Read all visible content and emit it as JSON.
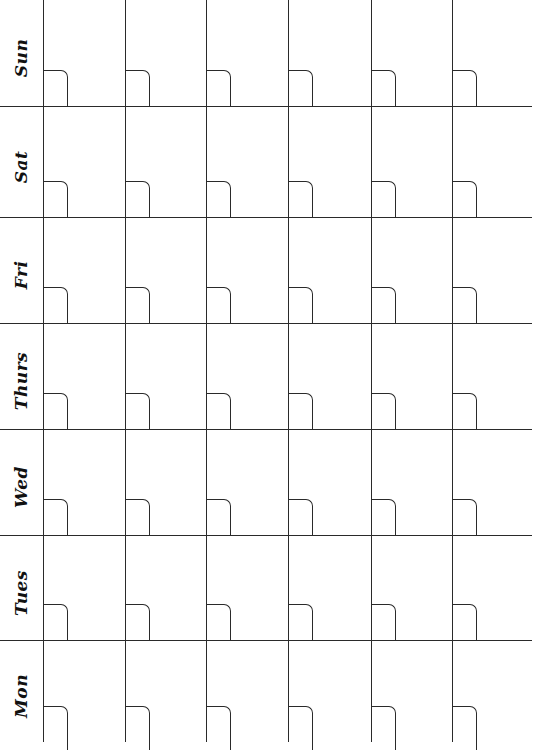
{
  "calendar": {
    "days": [
      {
        "label": "Sun"
      },
      {
        "label": "Sat"
      },
      {
        "label": "Fri"
      },
      {
        "label": "Thurs"
      },
      {
        "label": "Wed"
      },
      {
        "label": "Tues"
      },
      {
        "label": "Mon"
      }
    ],
    "week_columns": 6,
    "line_color": "#2a2a2a",
    "background": "#ffffff"
  }
}
